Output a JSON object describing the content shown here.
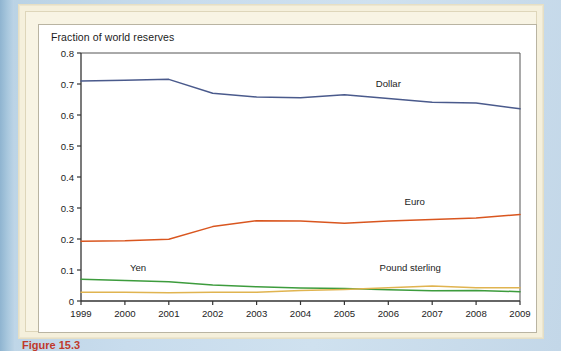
{
  "figure": {
    "caption": "Figure 15.3"
  },
  "chart": {
    "title": "Fraction of world reserves",
    "labels": {
      "dollar": "Dollar",
      "euro": "Euro",
      "yen": "Yen",
      "pound": "Pound sterling"
    }
  },
  "colors": {
    "dollar": "#4a5a8c",
    "euro": "#d9561f",
    "yen": "#3d9c3d",
    "pound": "#e0b450",
    "axis": "#333333",
    "plot_background": "#ffffff",
    "panel_background": "#f5f0dc",
    "page_background": "#c5d8e6"
  },
  "chart_data": {
    "type": "line",
    "title": "Fraction of world reserves",
    "xlabel": "",
    "ylabel": "",
    "x": [
      1999,
      2000,
      2001,
      2002,
      2003,
      2004,
      2005,
      2006,
      2007,
      2008,
      2009
    ],
    "xlim": [
      1999,
      2009
    ],
    "ylim": [
      0,
      0.8
    ],
    "yticks": [
      0,
      0.1,
      0.2,
      0.3,
      0.4,
      0.5,
      0.6,
      0.7,
      0.8
    ],
    "ytick_labels": [
      "0",
      "0.1",
      "0.2",
      "0.3",
      "0.4",
      "0.5",
      "0.6",
      "0.7",
      "0.8"
    ],
    "xticks": [
      1999,
      2000,
      2001,
      2002,
      2003,
      2004,
      2005,
      2006,
      2007,
      2008,
      2009
    ],
    "xtick_labels": [
      "1999",
      "2000",
      "2001",
      "2002",
      "2003",
      "2004",
      "2005",
      "2006",
      "2007",
      "2008",
      "2009"
    ],
    "grid": false,
    "legend": "inline-labels",
    "series": [
      {
        "name": "Dollar",
        "color": "#4a5a8c",
        "values": [
          0.71,
          0.712,
          0.715,
          0.67,
          0.658,
          0.656,
          0.665,
          0.653,
          0.641,
          0.639,
          0.62
        ]
      },
      {
        "name": "Euro",
        "color": "#d9561f",
        "values": [
          0.193,
          0.194,
          0.199,
          0.24,
          0.259,
          0.258,
          0.251,
          0.258,
          0.263,
          0.268,
          0.279
        ]
      },
      {
        "name": "Yen",
        "color": "#3d9c3d",
        "values": [
          0.07,
          0.066,
          0.062,
          0.052,
          0.046,
          0.042,
          0.04,
          0.036,
          0.033,
          0.034,
          0.03
        ]
      },
      {
        "name": "Pound sterling",
        "color": "#e0b450",
        "values": [
          0.028,
          0.028,
          0.027,
          0.028,
          0.028,
          0.034,
          0.037,
          0.043,
          0.048,
          0.043,
          0.043
        ]
      }
    ],
    "annotations": [
      {
        "text": "Dollar",
        "x": 2006.0,
        "y": 0.69
      },
      {
        "text": "Euro",
        "x": 2006.6,
        "y": 0.31
      },
      {
        "text": "Yen",
        "x": 2000.3,
        "y": 0.098
      },
      {
        "text": "Pound sterling",
        "x": 2006.5,
        "y": 0.098
      }
    ]
  }
}
